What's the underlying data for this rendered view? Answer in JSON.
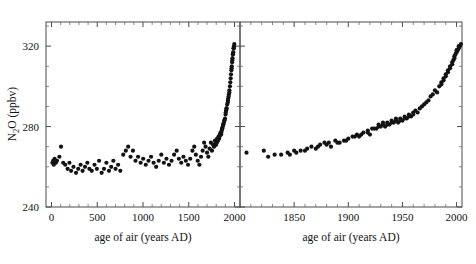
{
  "figure": {
    "ylabel_main": "N",
    "ylabel_sub": "2",
    "ylabel_rest": "O (ppbv)",
    "ylabel_full": "N2O (ppbv)"
  },
  "chart_data": {
    "type": "scatter",
    "title": "",
    "panels": [
      {
        "name": "left-panel",
        "xlabel": "age of air (years AD)",
        "ylabel": "N2O (ppbv)",
        "xlim": [
          -60,
          2060
        ],
        "ylim": [
          240,
          332
        ],
        "xticks": [
          0,
          500,
          1000,
          1500,
          2000
        ],
        "xticklabels": [
          "0",
          "500",
          "1000",
          "1500",
          "2000"
        ],
        "yticks": [
          240,
          280,
          320
        ],
        "yticklabels": [
          "240",
          "280",
          "320"
        ],
        "yticks_minor": [
          250,
          260,
          270,
          290,
          300,
          310,
          330
        ],
        "grid": false,
        "marker": "filled-circle",
        "marker_color": "#131313",
        "points": [
          [
            10,
            262
          ],
          [
            18,
            263
          ],
          [
            25,
            261
          ],
          [
            34,
            264
          ],
          [
            48,
            262
          ],
          [
            60,
            263
          ],
          [
            86,
            265
          ],
          [
            104,
            270
          ],
          [
            128,
            262
          ],
          [
            150,
            261
          ],
          [
            176,
            259
          ],
          [
            196,
            262
          ],
          [
            214,
            258
          ],
          [
            240,
            260
          ],
          [
            268,
            257
          ],
          [
            292,
            259
          ],
          [
            318,
            261
          ],
          [
            340,
            258
          ],
          [
            366,
            260
          ],
          [
            392,
            262
          ],
          [
            414,
            259
          ],
          [
            440,
            258
          ],
          [
            470,
            261
          ],
          [
            496,
            259
          ],
          [
            520,
            263
          ],
          [
            548,
            257
          ],
          [
            574,
            259
          ],
          [
            600,
            262
          ],
          [
            628,
            258
          ],
          [
            652,
            260
          ],
          [
            676,
            263
          ],
          [
            700,
            259
          ],
          [
            728,
            261
          ],
          [
            752,
            258
          ],
          [
            784,
            266
          ],
          [
            812,
            268
          ],
          [
            838,
            270
          ],
          [
            864,
            265
          ],
          [
            890,
            268
          ],
          [
            918,
            263
          ],
          [
            946,
            265
          ],
          [
            974,
            262
          ],
          [
            1002,
            264
          ],
          [
            1030,
            261
          ],
          [
            1060,
            263
          ],
          [
            1088,
            265
          ],
          [
            1116,
            262
          ],
          [
            1144,
            260
          ],
          [
            1172,
            263
          ],
          [
            1200,
            266
          ],
          [
            1228,
            262
          ],
          [
            1256,
            264
          ],
          [
            1284,
            261
          ],
          [
            1312,
            263
          ],
          [
            1340,
            266
          ],
          [
            1368,
            268
          ],
          [
            1392,
            264
          ],
          [
            1418,
            262
          ],
          [
            1442,
            265
          ],
          [
            1468,
            263
          ],
          [
            1492,
            261
          ],
          [
            1516,
            264
          ],
          [
            1540,
            268
          ],
          [
            1560,
            270
          ],
          [
            1578,
            266
          ],
          [
            1598,
            263
          ],
          [
            1616,
            261
          ],
          [
            1634,
            265
          ],
          [
            1652,
            268
          ],
          [
            1668,
            272
          ],
          [
            1684,
            270
          ],
          [
            1700,
            267
          ],
          [
            1714,
            265
          ],
          [
            1728,
            269
          ],
          [
            1742,
            272
          ],
          [
            1754,
            268
          ],
          [
            1766,
            271
          ],
          [
            1776,
            270
          ],
          [
            1786,
            273
          ],
          [
            1794,
            271
          ],
          [
            1802,
            272
          ],
          [
            1810,
            274
          ],
          [
            1818,
            273
          ],
          [
            1826,
            275
          ],
          [
            1832,
            274
          ],
          [
            1840,
            276
          ],
          [
            1848,
            277
          ],
          [
            1854,
            276
          ],
          [
            1860,
            278
          ],
          [
            1866,
            279
          ],
          [
            1872,
            280
          ],
          [
            1878,
            281
          ],
          [
            1884,
            282
          ],
          [
            1890,
            283
          ],
          [
            1896,
            284
          ],
          [
            1902,
            286
          ],
          [
            1908,
            288
          ],
          [
            1914,
            289
          ],
          [
            1920,
            291
          ],
          [
            1926,
            292
          ],
          [
            1932,
            294
          ],
          [
            1938,
            296
          ],
          [
            1944,
            298
          ],
          [
            1950,
            300
          ],
          [
            1954,
            302
          ],
          [
            1958,
            304
          ],
          [
            1962,
            306
          ],
          [
            1966,
            308
          ],
          [
            1970,
            310
          ],
          [
            1974,
            312
          ],
          [
            1978,
            314
          ],
          [
            1982,
            316
          ],
          [
            1986,
            317
          ],
          [
            1990,
            319
          ],
          [
            1994,
            320
          ],
          [
            1998,
            321
          ],
          [
            1968,
            309
          ],
          [
            1976,
            313
          ],
          [
            1984,
            316
          ],
          [
            1992,
            319
          ],
          [
            1944,
            297
          ],
          [
            1936,
            295
          ],
          [
            1928,
            293
          ],
          [
            1912,
            289
          ],
          [
            1904,
            287
          ],
          [
            1888,
            283
          ],
          [
            1876,
            281
          ],
          [
            1864,
            279
          ],
          [
            1856,
            277
          ],
          [
            1844,
            276
          ],
          [
            1836,
            275
          ],
          [
            1822,
            274
          ],
          [
            1814,
            273
          ],
          [
            1806,
            272
          ],
          [
            1798,
            271
          ]
        ]
      },
      {
        "name": "right-panel",
        "xlabel": "age of air (years AD)",
        "ylabel": "",
        "xlim": [
          1800,
          2005
        ],
        "ylim": [
          240,
          332
        ],
        "xticks": [
          1850,
          1900,
          1950,
          2000
        ],
        "xticklabels": [
          "1850",
          "1900",
          "1950",
          "2000"
        ],
        "yticks": [
          240,
          280,
          320
        ],
        "yticklabels": [
          "",
          "",
          ""
        ],
        "yticks_minor": [
          250,
          260,
          270,
          290,
          300,
          310,
          330
        ],
        "grid": false,
        "marker": "filled-circle",
        "marker_color": "#131313",
        "points": [
          [
            1806,
            267
          ],
          [
            1822,
            268
          ],
          [
            1826,
            265
          ],
          [
            1832,
            266
          ],
          [
            1838,
            266
          ],
          [
            1844,
            267
          ],
          [
            1850,
            268
          ],
          [
            1856,
            268
          ],
          [
            1862,
            269
          ],
          [
            1866,
            270
          ],
          [
            1870,
            269
          ],
          [
            1874,
            271
          ],
          [
            1878,
            272
          ],
          [
            1882,
            272
          ],
          [
            1884,
            270
          ],
          [
            1888,
            273
          ],
          [
            1892,
            272
          ],
          [
            1896,
            273
          ],
          [
            1900,
            274
          ],
          [
            1904,
            275
          ],
          [
            1908,
            276
          ],
          [
            1910,
            275
          ],
          [
            1914,
            277
          ],
          [
            1918,
            278
          ],
          [
            1920,
            276
          ],
          [
            1922,
            279
          ],
          [
            1926,
            279
          ],
          [
            1928,
            281
          ],
          [
            1930,
            280
          ],
          [
            1932,
            281
          ],
          [
            1934,
            280
          ],
          [
            1936,
            282
          ],
          [
            1938,
            281
          ],
          [
            1940,
            283
          ],
          [
            1942,
            282
          ],
          [
            1944,
            283
          ],
          [
            1946,
            282
          ],
          [
            1948,
            284
          ],
          [
            1950,
            283
          ],
          [
            1952,
            285
          ],
          [
            1954,
            284
          ],
          [
            1956,
            286
          ],
          [
            1958,
            285
          ],
          [
            1960,
            287
          ],
          [
            1962,
            288
          ],
          [
            1964,
            287
          ],
          [
            1966,
            289
          ],
          [
            1968,
            290
          ],
          [
            1970,
            291
          ],
          [
            1972,
            292
          ],
          [
            1974,
            293
          ],
          [
            1976,
            295
          ],
          [
            1978,
            296
          ],
          [
            1980,
            298
          ],
          [
            1982,
            297
          ],
          [
            1984,
            300
          ],
          [
            1986,
            302
          ],
          [
            1988,
            303
          ],
          [
            1990,
            305
          ],
          [
            1992,
            307
          ],
          [
            1994,
            309
          ],
          [
            1996,
            311
          ],
          [
            1997,
            313
          ],
          [
            1998,
            314
          ],
          [
            1999,
            316
          ],
          [
            2000,
            317
          ],
          [
            2001,
            318
          ],
          [
            2002,
            319
          ],
          [
            2003,
            320
          ],
          [
            2004,
            321
          ],
          [
            1986,
            301
          ],
          [
            1988,
            304
          ],
          [
            1990,
            306
          ],
          [
            1992,
            308
          ],
          [
            1994,
            310
          ],
          [
            1996,
            312
          ],
          [
            1998,
            315
          ],
          [
            2000,
            318
          ],
          [
            2002,
            320
          ],
          [
            1960,
            286
          ],
          [
            1956,
            285
          ],
          [
            1952,
            284
          ],
          [
            1948,
            283
          ],
          [
            1944,
            284
          ],
          [
            1940,
            282
          ],
          [
            1936,
            281
          ],
          [
            1932,
            282
          ],
          [
            1928,
            280
          ],
          [
            1924,
            279
          ],
          [
            1918,
            277
          ],
          [
            1912,
            276
          ],
          [
            1906,
            275
          ],
          [
            1898,
            273
          ],
          [
            1890,
            272
          ],
          [
            1880,
            271
          ],
          [
            1872,
            270
          ],
          [
            1860,
            268
          ],
          [
            1852,
            267
          ],
          [
            1846,
            266
          ]
        ]
      }
    ]
  }
}
